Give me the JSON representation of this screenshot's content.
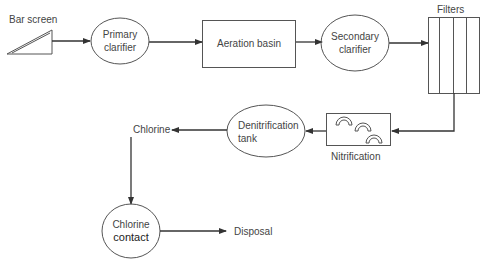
{
  "diagram": {
    "nodes": {
      "bar_screen": {
        "label": "Bar screen",
        "shape": "wedge"
      },
      "primary_clarifier": {
        "line1": "Primary",
        "line2": "clarifier",
        "shape": "ellipse"
      },
      "aeration_basin": {
        "label": "Aeration basin",
        "shape": "rectangle"
      },
      "secondary_clarifier": {
        "line1": "Secondary",
        "line2": "clarifier",
        "shape": "ellipse"
      },
      "filters": {
        "label": "Filters",
        "shape": "columns-box"
      },
      "nitrification": {
        "label": "Nitrification",
        "shape": "rectangle-with-arcs"
      },
      "denitrification_tank": {
        "line1": "Denitrification",
        "line2": "tank",
        "shape": "ellipse"
      },
      "chlorine": {
        "label": "Chlorine",
        "shape": "text"
      },
      "chlorine_contact": {
        "line1": "Chlorine",
        "line2": "contact",
        "shape": "circle"
      },
      "disposal": {
        "label": "Disposal",
        "shape": "text"
      }
    },
    "edges": [
      {
        "from": "Bar screen",
        "to": "Primary clarifier"
      },
      {
        "from": "Primary clarifier",
        "to": "Aeration basin"
      },
      {
        "from": "Aeration basin",
        "to": "Secondary clarifier"
      },
      {
        "from": "Secondary clarifier",
        "to": "Filters"
      },
      {
        "from": "Filters",
        "to": "Nitrification"
      },
      {
        "from": "Nitrification",
        "to": "Denitrification tank"
      },
      {
        "from": "Denitrification tank",
        "to": "Chlorine"
      },
      {
        "from": "Chlorine",
        "to": "Chlorine contact"
      },
      {
        "from": "Chlorine contact",
        "to": "Disposal"
      }
    ],
    "colors": {
      "stroke": "#555555",
      "arrow": "#333333",
      "text": "#444444"
    }
  }
}
